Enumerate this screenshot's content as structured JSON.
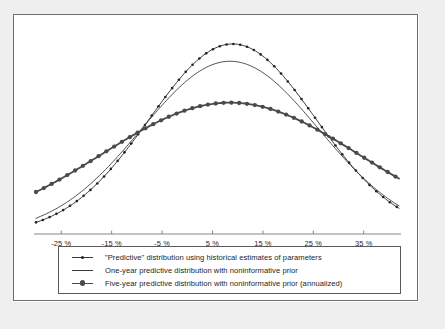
{
  "figure": {
    "background_color": "#ffffff",
    "margin_color": "#efefef",
    "frame_color": "#6e6e6e"
  },
  "chart_data": {
    "type": "line",
    "title": "",
    "xlabel": "",
    "ylabel": "",
    "xlim": [
      -30,
      42
    ],
    "ylim": [
      0,
      1.0
    ],
    "grid": false,
    "legend_position": "bottom",
    "tick_labels": [
      "-25 %",
      "-15 %",
      "-5 %",
      "5 %",
      "15 %",
      "25 %",
      "35 %"
    ],
    "tick_values": [
      -25,
      -15,
      -5,
      5,
      15,
      25,
      35
    ],
    "x": [
      -30,
      -28,
      -26,
      -24,
      -22,
      -20,
      -18,
      -16,
      -14,
      -12,
      -10,
      -8,
      -6,
      -4,
      -2,
      0,
      2,
      4,
      6,
      8,
      10,
      12,
      14,
      16,
      18,
      20,
      22,
      24,
      26,
      28,
      30,
      32,
      34,
      36,
      38,
      40,
      42
    ],
    "series": [
      {
        "name": "\"Predictive\" distribution using historical estimates of parameters",
        "mean": 9.0,
        "sigma": 16.5,
        "peak": 0.955,
        "marker": "small-dot",
        "marker_size": 2.6,
        "color": "#222222",
        "line_width": 0.9,
        "values": [
          0.126,
          0.159,
          0.197,
          0.24,
          0.288,
          0.341,
          0.397,
          0.456,
          0.517,
          0.578,
          0.638,
          0.696,
          0.75,
          0.8,
          0.844,
          0.882,
          0.913,
          0.936,
          0.951,
          0.955,
          0.951,
          0.936,
          0.913,
          0.882,
          0.844,
          0.8,
          0.75,
          0.696,
          0.638,
          0.578,
          0.517,
          0.456,
          0.397,
          0.341,
          0.288,
          0.24,
          0.197
        ]
      },
      {
        "name": "One-year predictive distribution with noninformative prior",
        "mean": 8.5,
        "sigma": 17.6,
        "peak": 0.868,
        "marker": "none",
        "color": "#3a3a3a",
        "line_width": 0.9,
        "values": [
          0.16,
          0.196,
          0.236,
          0.28,
          0.327,
          0.377,
          0.428,
          0.481,
          0.533,
          0.585,
          0.634,
          0.68,
          0.722,
          0.759,
          0.792,
          0.82,
          0.843,
          0.859,
          0.867,
          0.868,
          0.863,
          0.851,
          0.833,
          0.81,
          0.781,
          0.746,
          0.706,
          0.662,
          0.616,
          0.568,
          0.52,
          0.473,
          0.427,
          0.383,
          0.341,
          0.303,
          0.268
        ]
      },
      {
        "name": "Five-year predictive distribution with noninformative prior (annualized)",
        "mean": 8.5,
        "sigma": 25.5,
        "peak": 0.66,
        "marker": "large-dot",
        "marker_size": 4.3,
        "color": "#4a4a4a",
        "line_width": 1.8,
        "values": [
          0.28,
          0.311,
          0.343,
          0.375,
          0.407,
          0.438,
          0.469,
          0.499,
          0.527,
          0.553,
          0.578,
          0.6,
          0.619,
          0.635,
          0.648,
          0.656,
          0.66,
          0.66,
          0.657,
          0.65,
          0.639,
          0.625,
          0.608,
          0.589,
          0.567,
          0.543,
          0.518,
          0.491,
          0.464,
          0.436,
          0.408,
          0.38,
          0.352,
          0.325,
          0.299,
          0.274,
          0.25
        ]
      }
    ]
  },
  "legend": {
    "items": [
      {
        "swatch": "line-with-small-marker",
        "label": "\"Predictive\" distribution using historical estimates of parameters"
      },
      {
        "swatch": "plain-line",
        "label": "One-year predictive distribution with noninformative prior"
      },
      {
        "swatch": "thick-line-with-large-marker",
        "label": "Five-year predictive distribution with noninformative prior (annualized)"
      }
    ]
  }
}
